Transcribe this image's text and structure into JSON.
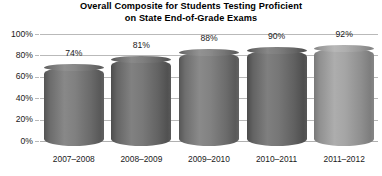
{
  "chart_data": {
    "type": "bar",
    "title": "Overall Composite for Students Testing Proficient on State End-of-Grade Exams",
    "title_line1": "Overall Composite for Students Testing Proficient",
    "title_line2": "on State End-of-Grade Exams",
    "xlabel": "",
    "ylabel": "",
    "categories": [
      "2007–2008",
      "2008–2009",
      "2009–2010",
      "2010–2011",
      "2011–2012"
    ],
    "values": [
      74,
      81,
      88,
      90,
      92
    ],
    "data_labels": [
      "74%",
      "81%",
      "88%",
      "90%",
      "92%"
    ],
    "ylim": [
      0,
      100
    ],
    "yticks": [
      0,
      20,
      40,
      60,
      80,
      100
    ],
    "ytick_labels": [
      "0%",
      "20%",
      "40%",
      "60%",
      "80%",
      "100%"
    ],
    "grid": true,
    "legend": false,
    "bar_style": "3d-cylinder",
    "bar_colors": [
      "#767676",
      "#6f6f6f",
      "#787878",
      "#6d6d6d",
      "#9b9b9b"
    ]
  },
  "colors": {
    "background": "#ffffff",
    "gridline": "#b9b9b9",
    "text": "#1a1a1a",
    "bar_default": "#767676",
    "bar_highlight": "#9b9b9b"
  }
}
